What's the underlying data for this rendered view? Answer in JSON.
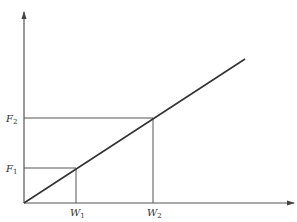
{
  "diagram": {
    "type": "linear force-vs-work graph",
    "colors": {
      "axis": "#555555",
      "line": "#333333",
      "guide": "#555555",
      "background": "#ffffff"
    },
    "axes": {
      "x": {
        "arrow": true
      },
      "y": {
        "arrow": true
      }
    },
    "labels": {
      "f1": {
        "main": "F",
        "sub": "1"
      },
      "f2": {
        "main": "F",
        "sub": "2"
      },
      "w1": {
        "main": "W",
        "sub": "1"
      },
      "w2": {
        "main": "W",
        "sub": "2"
      }
    },
    "line": {
      "from": "origin",
      "slope": "positive, passes through (W1,F1) and (W2,F2)"
    }
  }
}
